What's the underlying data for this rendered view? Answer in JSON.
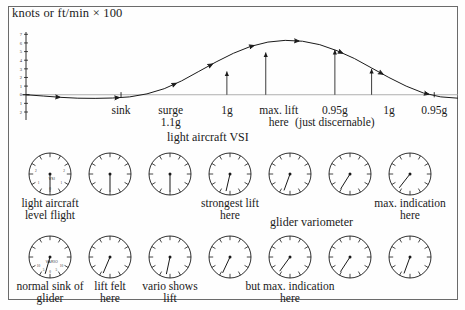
{
  "figure": {
    "frame_color": "#6b6b6b",
    "ink_color": "#1a1a1a",
    "background": "#fefefe"
  },
  "chart_data": {
    "type": "line",
    "title": "knots or ft/min × 100",
    "xlabel": "",
    "ylabel": "knots or ft/min × 100",
    "grid": false,
    "legend": "none",
    "ylim": [
      -2,
      7.5
    ],
    "y_ticks": [
      "7",
      "6",
      "5",
      "4",
      "3",
      "2",
      "1",
      "0",
      "1",
      "2"
    ],
    "y_tick_values": [
      7,
      6,
      5,
      4,
      3,
      2,
      1,
      0,
      -1,
      -2
    ],
    "x": [
      0,
      4,
      8,
      12,
      16,
      20,
      24,
      28,
      32,
      36,
      40,
      44,
      48,
      52,
      56,
      60,
      64,
      68,
      72,
      76,
      80,
      84,
      88,
      92,
      96,
      100
    ],
    "y": [
      0.0,
      -0.15,
      -0.3,
      -0.4,
      -0.42,
      -0.38,
      -0.25,
      0.1,
      0.7,
      1.6,
      2.7,
      3.8,
      4.8,
      5.6,
      6.1,
      6.3,
      6.2,
      5.8,
      5.1,
      4.2,
      3.1,
      2.0,
      1.0,
      0.2,
      -0.25,
      -0.4
    ],
    "series": [
      {
        "name": "vertical air motion through a thermal",
        "values": [
          0.0,
          -0.15,
          -0.3,
          -0.4,
          -0.42,
          -0.38,
          -0.25,
          0.1,
          0.7,
          1.6,
          2.7,
          3.8,
          4.8,
          5.6,
          6.1,
          6.3,
          6.2,
          5.8,
          5.1,
          4.2,
          3.1,
          2.0,
          1.0,
          0.2,
          -0.25,
          -0.4
        ]
      }
    ],
    "annotations": [
      {
        "label": "sink",
        "line2": "",
        "x_pct": 22.0
      },
      {
        "label": "surge",
        "line2": "1.1g",
        "x_pct": 33.5
      },
      {
        "label": "1g",
        "line2": "",
        "x_pct": 46.5
      },
      {
        "label": "max. lift",
        "line2": "here",
        "x_pct": 58.5
      },
      {
        "label": "0.95g",
        "line2": "(just discernable)",
        "x_pct": 71.5
      },
      {
        "label": "1g",
        "line2": "",
        "x_pct": 84.0
      },
      {
        "label": "0.95g",
        "line2": "",
        "x_pct": 94.5
      }
    ],
    "g_markers": [
      {
        "name": "1g",
        "x_pct": 46.5,
        "height": 2.7
      },
      {
        "name": "unlabelled",
        "x_pct": 55.5,
        "height": 4.9
      },
      {
        "name": "0.95g",
        "x_pct": 71.5,
        "height": 5.2
      },
      {
        "name": "1g",
        "x_pct": 80.0,
        "height": 3.0
      },
      {
        "name": "tick-sink-left",
        "x_pct": 22.0,
        "height": 0.0
      },
      {
        "name": "tick-sink-right",
        "x_pct": 94.5,
        "height": 0.0
      }
    ],
    "flow_arrows": [
      0.07,
      0.2,
      0.33,
      0.42,
      0.52,
      0.62,
      0.72,
      0.82,
      0.93
    ]
  },
  "rows": [
    {
      "id": "vsi-row",
      "heading": "light aircraft VSI",
      "instrument_label": "VSI",
      "face_numbers": [
        "0",
        "1",
        "2",
        "1",
        "2"
      ],
      "captions": [
        {
          "text": "light aircraft",
          "line2": "level flight",
          "dial": 0
        },
        {
          "text": "strongest lift",
          "line2": "here",
          "dial": 3
        },
        {
          "text": "max. indication",
          "line2": "here",
          "dial": 6
        }
      ],
      "needle_angles_deg": [
        180,
        180,
        180,
        193,
        200,
        212,
        218
      ]
    },
    {
      "id": "vario-row",
      "heading": "glider variometer",
      "instrument_label": "VARIO",
      "face_numbers": [
        "10",
        "5",
        "0",
        "5",
        "10"
      ],
      "captions": [
        {
          "text": "normal sink of",
          "line2": "glider",
          "dial": 0
        },
        {
          "text": "lift felt",
          "line2": "here",
          "dial": 1
        },
        {
          "text": "vario shows",
          "line2": "lift",
          "dial": 2
        },
        {
          "text": "but max. indication",
          "line2": "here",
          "dial": 4
        }
      ],
      "needle_angles_deg": [
        196,
        203,
        192,
        205,
        216,
        213,
        200
      ]
    }
  ],
  "dial_geometry": {
    "row1_top": 150,
    "row2_top": 233,
    "radius": 21,
    "centers_x": [
      50,
      110,
      170,
      230,
      290,
      350,
      410
    ]
  }
}
